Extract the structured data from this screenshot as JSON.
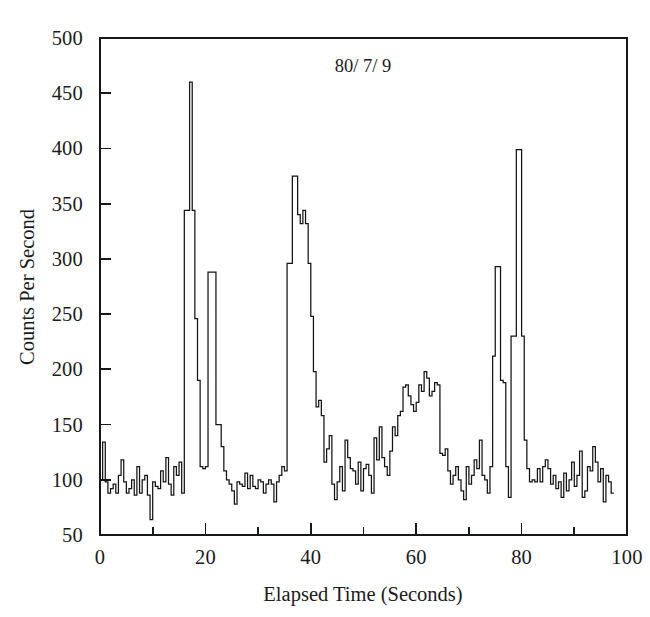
{
  "chart_data": {
    "type": "line",
    "subtype": "step-histogram",
    "title": "80/ 7/ 9",
    "title_position": "inside-top-center",
    "xlabel": "Elapsed Time (Seconds)",
    "ylabel": "Counts Per Second",
    "xlim": [
      0,
      100
    ],
    "ylim": [
      50,
      500
    ],
    "xticks": [
      0,
      10,
      20,
      30,
      40,
      50,
      60,
      70,
      80,
      90,
      100
    ],
    "xtick_labels": [
      "0",
      "",
      "20",
      "",
      "40",
      "",
      "60",
      "",
      "80",
      "",
      "100"
    ],
    "yticks": [
      50,
      100,
      150,
      200,
      250,
      300,
      350,
      400,
      450,
      500
    ],
    "ytick_labels": [
      "50",
      "100",
      "150",
      "200",
      "250",
      "300",
      "350",
      "400",
      "450",
      "500"
    ],
    "grid": false,
    "legend": false,
    "line_color": "#141414",
    "frame_color": "#16181a",
    "background": "#ffffff",
    "sample_interval_seconds": 0.5,
    "x_start": 0,
    "series": [
      {
        "name": "Counts Per Second",
        "values": [
          100,
          134,
          98,
          88,
          92,
          96,
          88,
          104,
          118,
          98,
          88,
          92,
          100,
          86,
          112,
          88,
          100,
          104,
          86,
          64,
          98,
          94,
          92,
          108,
          98,
          120,
          96,
          86,
          112,
          104,
          116,
          88,
          344,
          344,
          460,
          344,
          246,
          190,
          112,
          110,
          112,
          288,
          288,
          288,
          150,
          150,
          130,
          108,
          100,
          96,
          90,
          78,
          98,
          96,
          94,
          106,
          92,
          104,
          94,
          92,
          100,
          98,
          88,
          96,
          100,
          96,
          80,
          98,
          104,
          112,
          108,
          296,
          296,
          375,
          375,
          340,
          332,
          344,
          332,
          296,
          248,
          198,
          166,
          172,
          158,
          116,
          128,
          140,
          96,
          82,
          98,
          112,
          90,
          136,
          120,
          110,
          108,
          96,
          116,
          90,
          110,
          114,
          104,
          88,
          138,
          118,
          148,
          120,
          112,
          104,
          126,
          148,
          140,
          158,
          162,
          184,
          186,
          176,
          168,
          162,
          170,
          186,
          180,
          198,
          192,
          176,
          180,
          188,
          186,
          124,
          122,
          128,
          108,
          96,
          104,
          112,
          100,
          90,
          82,
          112,
          96,
          104,
          118,
          110,
          136,
          104,
          100,
          88,
          112,
          212,
          293,
          293,
          190,
          188,
          112,
          84,
          230,
          230,
          399,
          399,
          230,
          136,
          110,
          98,
          100,
          98,
          110,
          98,
          112,
          118,
          110,
          96,
          104,
          92,
          98,
          84,
          106,
          90,
          100,
          116,
          94,
          104,
          126,
          84,
          90,
          112,
          108,
          130,
          116,
          98,
          110,
          80,
          104,
          98,
          88
        ]
      }
    ]
  },
  "axes": {
    "plot_rect": {
      "left": 100,
      "top": 38,
      "right": 627,
      "bottom": 535
    }
  }
}
